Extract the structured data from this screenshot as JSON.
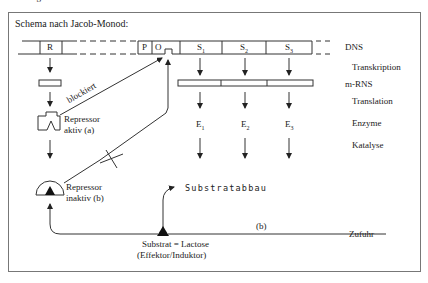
{
  "header_cut": "Lösungen:",
  "title": "Schema nach Jacob-Monod:",
  "dna": {
    "segments": [
      "R",
      "P",
      "O",
      "S",
      "S",
      "S"
    ],
    "genes": [
      {
        "label": "S",
        "sub": "1"
      },
      {
        "label": "S",
        "sub": "2"
      },
      {
        "label": "S",
        "sub": "3"
      }
    ],
    "regulator": "R",
    "promoter": "P",
    "operator": "O"
  },
  "enzymes": [
    {
      "label": "E",
      "sub": "1"
    },
    {
      "label": "E",
      "sub": "2"
    },
    {
      "label": "E",
      "sub": "3"
    }
  ],
  "side_labels": {
    "dns": "DNS",
    "transkription": "Transkription",
    "mrns": "m-RNS",
    "translation": "Translation",
    "enzyme": "Enzyme",
    "katalyse": "Katalyse"
  },
  "repressor_active": {
    "line1": "Repressor",
    "line2": "aktiv  (a)"
  },
  "repressor_inactive": {
    "line1": "Repressor",
    "line2": "inaktiv  (b)"
  },
  "blockiert": "blockiert",
  "substratabbau": "Substratabbau",
  "substrate": {
    "line1": "Substrat = Lactose",
    "line2": "(Effektor/Induktor)"
  },
  "path_b": "(b)",
  "zufuhr": "Zufuhr"
}
